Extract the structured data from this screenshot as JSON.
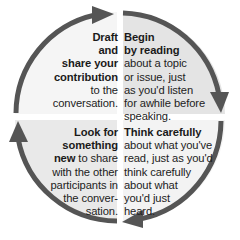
{
  "diagram": {
    "type": "cycle",
    "direction": "clockwise",
    "colors": {
      "arrow": "#555555",
      "quadrant_top_left": "#f5f5f5",
      "quadrant_top_right": "#e4e4e4",
      "quadrant_bottom_left": "#e9e9e9",
      "quadrant_bottom_right": "#f3f3f3"
    },
    "steps": [
      {
        "position": "top-right",
        "order": 1,
        "bold_lines": [
          "Begin",
          "by reading"
        ],
        "text_lines": [
          "about a topic",
          "or issue, just",
          "as you'd listen",
          "for awhile before",
          "speaking."
        ]
      },
      {
        "position": "bottom-right",
        "order": 2,
        "bold_lines": [
          "Think carefully"
        ],
        "text_lines": [
          "about what you've",
          "read, just as you'd",
          "think carefully",
          "about what",
          "you'd just",
          "heard."
        ]
      },
      {
        "position": "bottom-left",
        "order": 3,
        "bold_lines": [
          "Look for",
          "something"
        ],
        "mixed_line": {
          "bold": "new",
          "text": " to share"
        },
        "text_lines": [
          "with the other",
          "participants in",
          "the conver-",
          "sation."
        ]
      },
      {
        "position": "top-left",
        "order": 4,
        "bold_lines": [
          "Draft",
          "and",
          "share your",
          "contribution"
        ],
        "text_lines": [
          "to the",
          "conversation."
        ]
      }
    ]
  }
}
